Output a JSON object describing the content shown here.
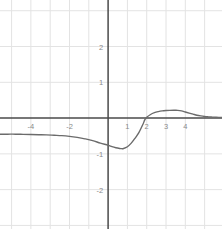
{
  "figure": {
    "width": 222,
    "height": 229,
    "background_color": "#ffffff"
  },
  "chart_data": {
    "type": "line",
    "title": "",
    "subtitle": "",
    "xlabel": "",
    "ylabel": "",
    "xlim": [
      -5.6,
      5.9
    ],
    "ylim": [
      -3.1,
      3.3
    ],
    "grid": true,
    "grid_color": "#e3e3e3",
    "grid_step": 1,
    "axis_color": "#4a4a4a",
    "legend": null,
    "legend_position": "none",
    "annotations": [],
    "xticks": [
      -4,
      -2,
      1,
      2,
      3,
      4
    ],
    "xtick_labels": [
      "-4",
      "-2",
      "1",
      "2",
      "3",
      "4"
    ],
    "yticks": [
      2,
      1,
      -1,
      -2
    ],
    "ytick_labels": [
      "2",
      "1",
      "-1",
      "-2"
    ],
    "tick_label_color": "#8a8a8a",
    "series": [
      {
        "name": "curve",
        "color": "#6b6b6b",
        "line_width": 1.4,
        "x": [
          -5.6,
          -5.2,
          -4.8,
          -4.4,
          -4.0,
          -3.6,
          -3.2,
          -2.8,
          -2.4,
          -2.0,
          -1.6,
          -1.2,
          -0.8,
          -0.4,
          0.0,
          0.2,
          0.4,
          0.6,
          0.7,
          0.8,
          1.0,
          1.2,
          1.4,
          1.6,
          1.8,
          1.9,
          2.0,
          2.2,
          2.4,
          2.6,
          2.8,
          3.0,
          3.2,
          3.4,
          3.5,
          3.6,
          3.8,
          4.0,
          4.2,
          4.4,
          4.6,
          4.8,
          5.0,
          5.2,
          5.4,
          5.6,
          5.9
        ],
        "y": [
          -0.45,
          -0.45,
          -0.45,
          -0.455,
          -0.46,
          -0.465,
          -0.47,
          -0.48,
          -0.49,
          -0.51,
          -0.54,
          -0.58,
          -0.63,
          -0.7,
          -0.76,
          -0.8,
          -0.83,
          -0.85,
          -0.855,
          -0.85,
          -0.8,
          -0.7,
          -0.56,
          -0.4,
          -0.18,
          -0.05,
          0.02,
          0.1,
          0.15,
          0.18,
          0.2,
          0.21,
          0.215,
          0.218,
          0.218,
          0.215,
          0.2,
          0.17,
          0.14,
          0.11,
          0.08,
          0.06,
          0.045,
          0.035,
          0.028,
          0.022,
          0.015
        ]
      }
    ],
    "features": {
      "left_asymptote_y": -0.45,
      "minimum": {
        "x": 0.7,
        "y": -0.855
      },
      "zero_crossing_x": 1.93,
      "local_maximum": {
        "x": 3.45,
        "y": 0.218
      }
    }
  }
}
